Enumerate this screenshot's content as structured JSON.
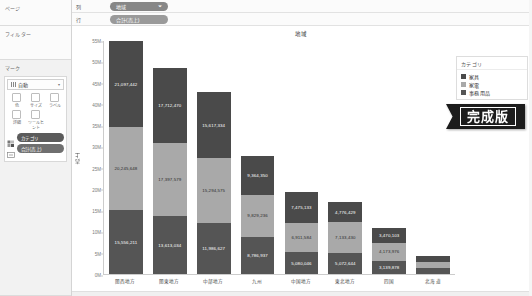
{
  "sidebar": {
    "pages_label": "ページ",
    "filters_label": "フィルター",
    "marks_label": "マーク",
    "mark_type": "自動",
    "mark_type_caret": "▾",
    "mark_buttons": [
      {
        "icon": "color-icon",
        "label": "色"
      },
      {
        "icon": "size-icon",
        "label": "サイズ"
      },
      {
        "icon": "label-icon",
        "label": "ラベル"
      },
      {
        "icon": "detail-icon",
        "label": "詳細"
      },
      {
        "icon": "tooltip-icon",
        "label": "ツールヒント"
      }
    ],
    "shelf_pills": [
      {
        "icon": "color-legend-icon",
        "label": "カテゴリ"
      },
      {
        "icon": "label-shelf-icon",
        "label": "合計(売上)"
      }
    ]
  },
  "shelves": {
    "columns_label": "列",
    "rows_label": "行",
    "columns_pill": "地域",
    "columns_pill_caret": "⏷",
    "rows_pill": "合計(売上)"
  },
  "chart_data": {
    "type": "bar",
    "stacked": true,
    "title": "地域",
    "xlabel": "",
    "ylabel": "売上",
    "ylim": [
      0,
      55000000
    ],
    "ytick_labels": [
      "0M",
      "5M",
      "10M",
      "15M",
      "20M",
      "25M",
      "30M",
      "35M",
      "40M",
      "45M",
      "50M",
      "55M"
    ],
    "ytick_values": [
      0,
      5000000,
      10000000,
      15000000,
      20000000,
      25000000,
      30000000,
      35000000,
      40000000,
      45000000,
      50000000,
      55000000
    ],
    "grid": false,
    "legend_position": "right",
    "legend_title": "カテゴリ",
    "categories": [
      "関西地方",
      "関東地方",
      "中部地方",
      "九州",
      "中国地方",
      "東北地方",
      "四国",
      "北海道"
    ],
    "series": [
      {
        "name": "事務用品",
        "color": "#555555",
        "values": [
          15556211,
          13613034,
          11986627,
          8786937,
          5080046,
          5072644,
          3139878,
          1450000
        ],
        "labels": [
          "15,556,211",
          "13,613,034",
          "11,986,627",
          "8,786,937",
          "5,080,046",
          "5,072,644",
          "3,139,878",
          ""
        ]
      },
      {
        "name": "家電",
        "color": "#a9a9a9",
        "values": [
          20245648,
          17397579,
          15294575,
          9829236,
          6911584,
          7133430,
          4173976,
          1460000
        ],
        "labels": [
          "20,245,648",
          "17,397,579",
          "15,294,575",
          "9,829,236",
          "6,911,584",
          "7,133,430",
          "4,173,976",
          ""
        ]
      },
      {
        "name": "家具",
        "color": "#4a4a4a",
        "values": [
          21097442,
          17712470,
          15617334,
          9364350,
          7475133,
          4776429,
          3470103,
          1420000
        ],
        "labels": [
          "21,097,442",
          "17,712,470",
          "15,617,334",
          "9,364,350",
          "7,475,133",
          "4,776,429",
          "3,470,103",
          ""
        ]
      }
    ],
    "legend_entries": [
      {
        "label": "家具",
        "color": "#4a4a4a"
      },
      {
        "label": "家電",
        "color": "#a9a9a9"
      },
      {
        "label": "事務用品",
        "color": "#555555"
      }
    ]
  },
  "badge": {
    "text": "完成版"
  }
}
